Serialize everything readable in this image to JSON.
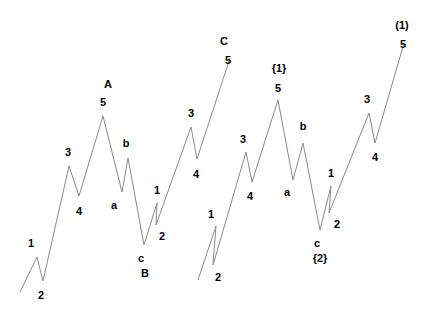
{
  "figure": {
    "background_color": "#ffffff",
    "line_color": "#8a8a8a",
    "label_color": "#000000",
    "width": 427,
    "height": 319
  },
  "chart_data": {
    "type": "line",
    "title": "",
    "xlabel": "",
    "ylabel": "",
    "grid": false,
    "legend": false,
    "xlim": [
      0,
      427
    ],
    "ylim": [
      319,
      0
    ],
    "axes_visible": false,
    "series": [
      {
        "name": "segment-left",
        "points": [
          [
            20,
            292
          ],
          [
            37,
            257
          ],
          [
            43,
            281
          ],
          [
            69,
            166
          ],
          [
            79,
            196
          ],
          [
            103,
            116
          ],
          [
            122,
            192
          ],
          [
            128,
            158
          ],
          [
            144,
            245
          ],
          [
            157,
            203
          ],
          [
            156,
            225
          ],
          [
            191,
            127
          ],
          [
            197,
            159
          ],
          [
            230,
            58
          ]
        ]
      },
      {
        "name": "segment-right",
        "points": [
          [
            198,
            280
          ],
          [
            216,
            226
          ],
          [
            213,
            265
          ],
          [
            246,
            152
          ],
          [
            252,
            182
          ],
          [
            278,
            100
          ],
          [
            293,
            180
          ],
          [
            303,
            143
          ],
          [
            320,
            230
          ],
          [
            331,
            186
          ],
          [
            329,
            213
          ],
          [
            369,
            113
          ],
          [
            375,
            143
          ],
          [
            404,
            43
          ]
        ]
      }
    ],
    "annotations": [
      {
        "text": "1",
        "x": 31,
        "y": 243,
        "style": "degree-minor"
      },
      {
        "text": "2",
        "x": 41,
        "y": 295,
        "style": "degree-minor"
      },
      {
        "text": "3",
        "x": 68,
        "y": 152,
        "style": "degree-minor"
      },
      {
        "text": "4",
        "x": 79,
        "y": 211,
        "style": "degree-minor"
      },
      {
        "text": "A",
        "x": 108,
        "y": 84,
        "style": "degree-major"
      },
      {
        "text": "5",
        "x": 103,
        "y": 102,
        "style": "degree-minor"
      },
      {
        "text": "a",
        "x": 114,
        "y": 205,
        "style": "degree-minor"
      },
      {
        "text": "b",
        "x": 126,
        "y": 143,
        "style": "degree-minor"
      },
      {
        "text": "c",
        "x": 141,
        "y": 258,
        "style": "degree-minor"
      },
      {
        "text": "B",
        "x": 145,
        "y": 273,
        "style": "degree-major"
      },
      {
        "text": "1",
        "x": 157,
        "y": 190,
        "style": "degree-minor"
      },
      {
        "text": "2",
        "x": 162,
        "y": 236,
        "style": "degree-minor"
      },
      {
        "text": "3",
        "x": 191,
        "y": 113,
        "style": "degree-minor"
      },
      {
        "text": "4",
        "x": 196,
        "y": 174,
        "style": "degree-minor"
      },
      {
        "text": "C",
        "x": 224,
        "y": 41,
        "style": "degree-major"
      },
      {
        "text": "5",
        "x": 228,
        "y": 60,
        "style": "degree-minor"
      },
      {
        "text": "1",
        "x": 211,
        "y": 214,
        "style": "degree-minor"
      },
      {
        "text": "2",
        "x": 218,
        "y": 277,
        "style": "degree-minor"
      },
      {
        "text": "3",
        "x": 243,
        "y": 139,
        "style": "degree-minor"
      },
      {
        "text": "4",
        "x": 250,
        "y": 196,
        "style": "degree-minor"
      },
      {
        "text": "{1}",
        "x": 279,
        "y": 68,
        "style": "degree-bracket"
      },
      {
        "text": "5",
        "x": 278,
        "y": 88,
        "style": "degree-minor"
      },
      {
        "text": "a",
        "x": 287,
        "y": 192,
        "style": "degree-minor"
      },
      {
        "text": "b",
        "x": 303,
        "y": 126,
        "style": "degree-minor"
      },
      {
        "text": "c",
        "x": 317,
        "y": 243,
        "style": "degree-minor"
      },
      {
        "text": "{2}",
        "x": 320,
        "y": 258,
        "style": "degree-bracket"
      },
      {
        "text": "1",
        "x": 331,
        "y": 173,
        "style": "degree-minor"
      },
      {
        "text": "2",
        "x": 337,
        "y": 224,
        "style": "degree-minor"
      },
      {
        "text": "3",
        "x": 367,
        "y": 99,
        "style": "degree-minor"
      },
      {
        "text": "4",
        "x": 375,
        "y": 157,
        "style": "degree-minor"
      },
      {
        "text": "(1)",
        "x": 402,
        "y": 25,
        "style": "degree-bracket"
      },
      {
        "text": "5",
        "x": 403,
        "y": 44,
        "style": "degree-minor"
      }
    ]
  }
}
